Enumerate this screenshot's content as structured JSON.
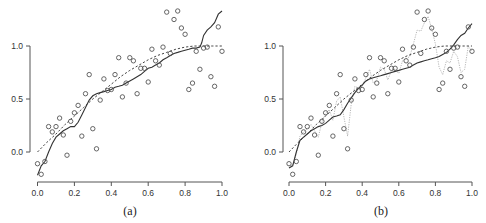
{
  "chart_data": [
    {
      "panel": "a",
      "type": "scatter",
      "caption": "(a)",
      "title": "",
      "xlabel": "",
      "ylabel": "",
      "xlim": [
        0.0,
        1.0
      ],
      "ylim": [
        -0.25,
        1.35
      ],
      "grid": false,
      "x_ticks": [
        "0.0",
        "0.2",
        "0.4",
        "0.6",
        "0.8",
        "1.0"
      ],
      "y_ticks": [
        "0.0",
        "0.5",
        "1.0"
      ],
      "points": {
        "x": [
          0.0,
          0.02,
          0.04,
          0.06,
          0.08,
          0.1,
          0.12,
          0.14,
          0.16,
          0.18,
          0.2,
          0.22,
          0.24,
          0.26,
          0.28,
          0.3,
          0.32,
          0.34,
          0.36,
          0.38,
          0.4,
          0.42,
          0.44,
          0.46,
          0.48,
          0.5,
          0.52,
          0.54,
          0.56,
          0.58,
          0.6,
          0.62,
          0.64,
          0.66,
          0.68,
          0.7,
          0.72,
          0.74,
          0.76,
          0.78,
          0.8,
          0.82,
          0.84,
          0.86,
          0.88,
          0.9,
          0.92,
          0.94,
          0.96,
          0.98,
          1.0
        ],
        "y": [
          -0.11,
          -0.21,
          -0.09,
          0.24,
          0.19,
          0.24,
          0.32,
          0.16,
          -0.03,
          0.29,
          0.37,
          0.44,
          0.15,
          0.55,
          0.73,
          0.22,
          0.03,
          0.49,
          0.69,
          0.58,
          0.59,
          0.73,
          0.89,
          0.52,
          0.65,
          0.89,
          0.86,
          0.55,
          0.79,
          0.79,
          0.66,
          0.97,
          0.86,
          0.82,
          0.99,
          1.32,
          0.93,
          1.25,
          1.33,
          1.17,
          1.11,
          0.59,
          0.65,
          0.95,
          0.78,
          0.98,
          0.99,
          0.71,
          0.62,
          1.18,
          0.95
        ]
      },
      "series": [
        {
          "name": "true function",
          "style": "dashed",
          "x": [
            0.0,
            0.05,
            0.1,
            0.15,
            0.2,
            0.25,
            0.3,
            0.35,
            0.4,
            0.45,
            0.5,
            0.55,
            0.6,
            0.65,
            0.7,
            0.75,
            0.8,
            0.85,
            0.9,
            0.95,
            1.0
          ],
          "y": [
            0.0,
            0.09,
            0.17,
            0.26,
            0.34,
            0.42,
            0.5,
            0.57,
            0.64,
            0.71,
            0.77,
            0.82,
            0.87,
            0.91,
            0.94,
            0.97,
            0.99,
            1.0,
            1.0,
            1.0,
            1.0
          ]
        },
        {
          "name": "fitted estimate",
          "style": "solid",
          "x": [
            0.0,
            0.02,
            0.04,
            0.06,
            0.08,
            0.1,
            0.12,
            0.14,
            0.16,
            0.18,
            0.2,
            0.22,
            0.24,
            0.26,
            0.28,
            0.3,
            0.32,
            0.34,
            0.36,
            0.38,
            0.4,
            0.42,
            0.44,
            0.46,
            0.48,
            0.5,
            0.52,
            0.54,
            0.56,
            0.58,
            0.6,
            0.62,
            0.64,
            0.66,
            0.68,
            0.7,
            0.72,
            0.74,
            0.76,
            0.78,
            0.8,
            0.82,
            0.84,
            0.86,
            0.88,
            0.89,
            0.9,
            0.92,
            0.94,
            0.96,
            0.98,
            1.0
          ],
          "y": [
            -0.22,
            -0.13,
            -0.09,
            0.0,
            0.08,
            0.14,
            0.17,
            0.2,
            0.22,
            0.24,
            0.24,
            0.28,
            0.35,
            0.42,
            0.49,
            0.53,
            0.55,
            0.56,
            0.57,
            0.58,
            0.59,
            0.61,
            0.62,
            0.63,
            0.65,
            0.67,
            0.69,
            0.71,
            0.73,
            0.76,
            0.79,
            0.8,
            0.82,
            0.84,
            0.87,
            0.89,
            0.91,
            0.93,
            0.94,
            0.95,
            0.96,
            0.97,
            0.98,
            0.98,
            0.99,
            1.03,
            1.1,
            1.15,
            1.18,
            1.22,
            1.3,
            1.33
          ]
        }
      ]
    },
    {
      "panel": "b",
      "type": "scatter",
      "caption": "(b)",
      "title": "",
      "xlabel": "",
      "ylabel": "",
      "xlim": [
        0.0,
        1.0
      ],
      "ylim": [
        -0.25,
        1.35
      ],
      "grid": false,
      "x_ticks": [
        "0.0",
        "0.2",
        "0.4",
        "0.6",
        "0.8",
        "1.0"
      ],
      "y_ticks": [
        "0.0",
        "0.5",
        "1.0"
      ],
      "points": {
        "x": [
          0.0,
          0.02,
          0.04,
          0.06,
          0.08,
          0.1,
          0.12,
          0.14,
          0.16,
          0.18,
          0.2,
          0.22,
          0.24,
          0.26,
          0.28,
          0.3,
          0.32,
          0.34,
          0.36,
          0.38,
          0.4,
          0.42,
          0.44,
          0.46,
          0.48,
          0.5,
          0.52,
          0.54,
          0.56,
          0.58,
          0.6,
          0.62,
          0.64,
          0.66,
          0.68,
          0.7,
          0.72,
          0.74,
          0.76,
          0.78,
          0.8,
          0.82,
          0.84,
          0.86,
          0.88,
          0.9,
          0.92,
          0.94,
          0.96,
          0.98,
          1.0
        ],
        "y": [
          -0.11,
          -0.21,
          -0.09,
          0.24,
          0.19,
          0.24,
          0.32,
          0.16,
          -0.03,
          0.29,
          0.37,
          0.44,
          0.15,
          0.55,
          0.73,
          0.22,
          0.03,
          0.49,
          0.69,
          0.58,
          0.59,
          0.73,
          0.89,
          0.52,
          0.65,
          0.89,
          0.86,
          0.55,
          0.79,
          0.79,
          0.66,
          0.97,
          0.86,
          0.82,
          0.99,
          1.32,
          0.93,
          1.25,
          1.33,
          1.17,
          1.11,
          0.59,
          0.65,
          0.95,
          0.78,
          0.98,
          0.99,
          0.71,
          0.62,
          1.18,
          0.95
        ]
      },
      "series": [
        {
          "name": "true function",
          "style": "dashed",
          "x": [
            0.0,
            0.05,
            0.1,
            0.15,
            0.2,
            0.25,
            0.3,
            0.35,
            0.4,
            0.45,
            0.5,
            0.55,
            0.6,
            0.65,
            0.7,
            0.75,
            0.8,
            0.85,
            0.9,
            0.95,
            1.0
          ],
          "y": [
            0.0,
            0.09,
            0.17,
            0.26,
            0.34,
            0.42,
            0.5,
            0.57,
            0.64,
            0.71,
            0.77,
            0.82,
            0.87,
            0.91,
            0.94,
            0.97,
            0.99,
            1.0,
            1.0,
            1.0,
            1.0
          ]
        },
        {
          "name": "smooth fit",
          "style": "solid",
          "x": [
            0.0,
            0.02,
            0.04,
            0.06,
            0.08,
            0.1,
            0.12,
            0.14,
            0.16,
            0.18,
            0.2,
            0.22,
            0.24,
            0.26,
            0.28,
            0.3,
            0.32,
            0.34,
            0.36,
            0.38,
            0.4,
            0.42,
            0.44,
            0.46,
            0.48,
            0.5,
            0.52,
            0.54,
            0.56,
            0.58,
            0.6,
            0.62,
            0.64,
            0.66,
            0.68,
            0.7,
            0.72,
            0.74,
            0.76,
            0.78,
            0.8,
            0.82,
            0.84,
            0.86,
            0.88,
            0.9,
            0.92,
            0.94,
            0.96,
            0.98,
            1.0
          ],
          "y": [
            -0.15,
            -0.13,
            0.0,
            0.11,
            0.14,
            0.17,
            0.2,
            0.22,
            0.24,
            0.25,
            0.27,
            0.3,
            0.33,
            0.34,
            0.35,
            0.4,
            0.46,
            0.51,
            0.56,
            0.6,
            0.63,
            0.67,
            0.69,
            0.7,
            0.71,
            0.72,
            0.73,
            0.74,
            0.75,
            0.76,
            0.77,
            0.78,
            0.79,
            0.8,
            0.82,
            0.84,
            0.85,
            0.86,
            0.87,
            0.88,
            0.89,
            0.9,
            0.92,
            0.94,
            0.97,
            1.01,
            1.06,
            1.1,
            1.12,
            1.17,
            1.21
          ]
        },
        {
          "name": "overfit estimate",
          "style": "dotted-light",
          "x": [
            0.0,
            0.02,
            0.04,
            0.06,
            0.08,
            0.1,
            0.12,
            0.14,
            0.16,
            0.18,
            0.2,
            0.22,
            0.24,
            0.26,
            0.28,
            0.3,
            0.32,
            0.34,
            0.36,
            0.38,
            0.4,
            0.42,
            0.44,
            0.46,
            0.48,
            0.5,
            0.52,
            0.54,
            0.56,
            0.58,
            0.6,
            0.62,
            0.64,
            0.66,
            0.68,
            0.7,
            0.72,
            0.74,
            0.76,
            0.78,
            0.8,
            0.82,
            0.84,
            0.86,
            0.88,
            0.9,
            0.92,
            0.94,
            0.96,
            0.98,
            1.0
          ],
          "y": [
            -0.15,
            -0.12,
            -0.02,
            0.15,
            0.19,
            0.22,
            0.26,
            0.2,
            0.14,
            0.28,
            0.36,
            0.4,
            0.3,
            0.48,
            0.52,
            0.33,
            0.15,
            0.45,
            0.62,
            0.6,
            0.62,
            0.7,
            0.78,
            0.65,
            0.68,
            0.8,
            0.78,
            0.68,
            0.77,
            0.78,
            0.74,
            0.86,
            0.88,
            0.9,
            1.02,
            1.15,
            1.14,
            1.22,
            1.28,
            1.16,
            1.02,
            0.8,
            0.73,
            0.86,
            0.84,
            0.95,
            0.9,
            0.75,
            0.78,
            1.0,
            0.95
          ]
        }
      ]
    }
  ],
  "panels": {
    "a": {
      "caption": "(a)"
    },
    "b": {
      "caption": "(b)"
    }
  }
}
